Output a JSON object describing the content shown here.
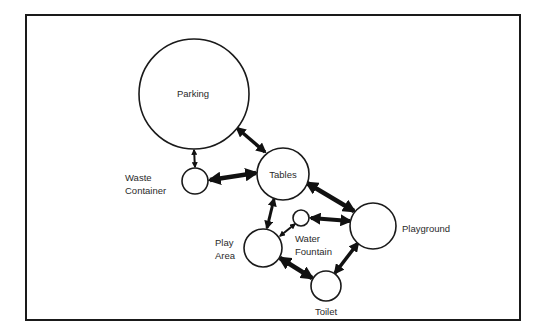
{
  "diagram": {
    "type": "bubble-adjacency",
    "frame": {
      "x": 26,
      "y": 15,
      "w": 494,
      "h": 305,
      "stroke": "#1a1a1a"
    },
    "nodes": [
      {
        "id": "parking",
        "label": "Parking",
        "cx": 194,
        "cy": 94,
        "r": 55,
        "label_pos": "inside"
      },
      {
        "id": "tables",
        "label": "Tables",
        "cx": 283,
        "cy": 174,
        "r": 26,
        "label_pos": "inside"
      },
      {
        "id": "waste",
        "label_lines": [
          "Waste",
          "Container"
        ],
        "cx": 195,
        "cy": 181,
        "r": 13,
        "label_pos": "left"
      },
      {
        "id": "fountain",
        "label_lines": [
          "Water",
          "Fountain"
        ],
        "cx": 301,
        "cy": 218,
        "r": 8,
        "label_pos": "below-right"
      },
      {
        "id": "playground",
        "label": "Playground",
        "cx": 373,
        "cy": 226,
        "r": 23,
        "label_pos": "right"
      },
      {
        "id": "playarea",
        "label_lines": [
          "Play",
          "Area"
        ],
        "cx": 263,
        "cy": 248,
        "r": 19,
        "label_pos": "left"
      },
      {
        "id": "toilet",
        "label": "Toilet",
        "cx": 326,
        "cy": 286,
        "r": 15,
        "label_pos": "below"
      }
    ],
    "edges": [
      {
        "from": "parking",
        "to": "tables",
        "weight": "medium"
      },
      {
        "from": "parking",
        "to": "waste",
        "weight": "light"
      },
      {
        "from": "waste",
        "to": "tables",
        "weight": "heavy"
      },
      {
        "from": "tables",
        "to": "playground",
        "weight": "heavy"
      },
      {
        "from": "tables",
        "to": "playarea",
        "weight": "medium"
      },
      {
        "from": "playground",
        "to": "fountain",
        "weight": "heavy"
      },
      {
        "from": "fountain",
        "to": "playarea",
        "weight": "light"
      },
      {
        "from": "playarea",
        "to": "toilet",
        "weight": "heavy"
      },
      {
        "from": "playground",
        "to": "toilet",
        "weight": "medium"
      }
    ]
  },
  "labels": {
    "parking": "Parking",
    "tables": "Tables",
    "waste_1": "Waste",
    "waste_2": "Container",
    "fountain_1": "Water",
    "fountain_2": "Fountain",
    "playground": "Playground",
    "playarea_1": "Play",
    "playarea_2": "Area",
    "toilet": "Toilet"
  }
}
